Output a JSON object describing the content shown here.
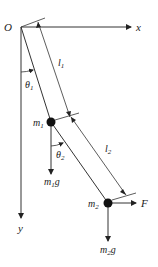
{
  "diagram": {
    "colors": {
      "line": "#333333",
      "mass": "#111111",
      "background": "#ffffff"
    },
    "labels": {
      "origin": "O",
      "x_axis": "x",
      "y_axis": "y",
      "length1": {
        "base": "l",
        "sub": "1"
      },
      "length2": {
        "base": "l",
        "sub": "2"
      },
      "theta1": {
        "base": "θ",
        "sub": "1"
      },
      "theta2": {
        "base": "θ",
        "sub": "2"
      },
      "mass1": {
        "base": "m",
        "sub": "1"
      },
      "mass2": {
        "base": "m",
        "sub": "2"
      },
      "weight1": {
        "base": "m",
        "sub": "1",
        "tail": "g"
      },
      "weight2": {
        "base": "m",
        "sub": "2",
        "tail": "g"
      },
      "force": "F"
    }
  }
}
